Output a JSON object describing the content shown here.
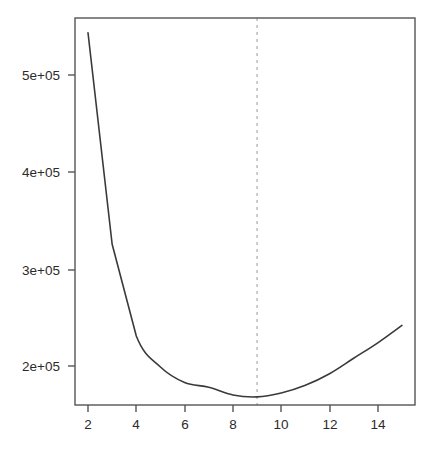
{
  "chart_data": {
    "type": "line",
    "title": "",
    "subtitle": "",
    "xlabel": "",
    "ylabel": "",
    "x": [
      2,
      3,
      4,
      5,
      6,
      7,
      8,
      9,
      10,
      11,
      12,
      13,
      14,
      15
    ],
    "values": [
      545000,
      326000,
      231000,
      199000,
      183000,
      178000,
      170000,
      168000,
      172000,
      180000,
      192000,
      208000,
      224000,
      242000
    ],
    "series": [
      {
        "name": "curve",
        "values": [
          545000,
          326000,
          231000,
          199000,
          183000,
          178000,
          170000,
          168000,
          172000,
          180000,
          192000,
          208000,
          224000,
          242000
        ]
      }
    ],
    "xlim": [
      1.5,
      15.6
    ],
    "ylim": [
      155000,
      563000
    ],
    "grid": false,
    "legend": false,
    "legend_position": "none",
    "line_color": "#3a3a3a",
    "axis_color": "#555555",
    "background": "#ffffff",
    "x_ticks": [
      2,
      4,
      6,
      8,
      10,
      12,
      14
    ],
    "x_tick_labels": [
      "2",
      "4",
      "6",
      "8",
      "10",
      "12",
      "14"
    ],
    "y_ticks": [
      200000,
      300000,
      400000,
      500000
    ],
    "y_tick_labels": [
      "2e+05",
      "3e+05",
      "4e+05",
      "5e+05"
    ],
    "annotations": [
      {
        "type": "vline",
        "name": "optimal-marker",
        "x": 9,
        "style": "dashed",
        "color": "#999999",
        "label": ""
      }
    ]
  }
}
